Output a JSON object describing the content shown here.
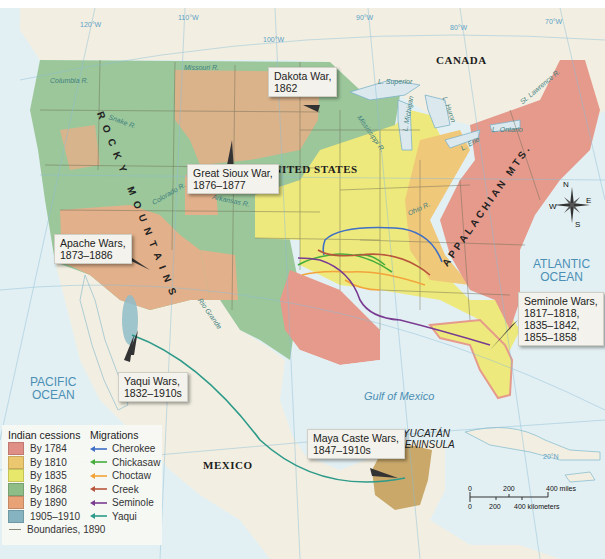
{
  "colors": {
    "ocean": "#e3f0f3",
    "land_other": "#f2efe2",
    "by_1784": "#e59a8c",
    "by_1810": "#f0c87a",
    "by_1835": "#eee97c",
    "by_1868": "#9cc79a",
    "by_1890": "#e2b08a",
    "by_1905_1910": "#8fbcc8",
    "yucatan": "#c9a86a",
    "cherokee": "#3f6fc6",
    "chickasaw": "#46ad3c",
    "choctaw": "#f2a33a",
    "creek": "#b8553d",
    "seminole": "#7a3c92",
    "yaqui": "#2e9a8a"
  },
  "regions": {
    "countries": [
      "CANADA",
      "UNITED STATES",
      "MEXICO"
    ],
    "oceans": [
      {
        "name": "PACIFIC\nOCEAN"
      },
      {
        "name": "ATLANTIC\nOCEAN"
      },
      {
        "name": "Gulf of Mexico"
      }
    ],
    "peninsula": "YUCATÁN\nPENINSULA",
    "mountains": [
      "ROCKY MOUNTAINS",
      "APPALACHIAN MTS."
    ],
    "rivers": [
      "Columbia R.",
      "Snake R.",
      "Missouri R.",
      "Colorado R.",
      "Arkansas R.",
      "Rio Grande",
      "Mississippi R.",
      "Ohio R.",
      "St. Lawrence R."
    ],
    "lakes": [
      "L. Superior",
      "L. Michigan",
      "L. Huron",
      "L. Erie",
      "L. Ontario"
    ]
  },
  "graticule": [
    "120°W",
    "110°W",
    "100°W",
    "90°W",
    "80°W",
    "70°W",
    "20°N"
  ],
  "callouts": [
    {
      "id": "dakota",
      "text": "Dakota War,\n1862"
    },
    {
      "id": "sioux",
      "text": "Great Sioux War,\n1876–1877"
    },
    {
      "id": "apache",
      "text": "Apache Wars,\n1873–1886"
    },
    {
      "id": "seminole",
      "text": "Seminole Wars,\n1817–1818,\n1835–1842,\n1855–1858"
    },
    {
      "id": "yaqui",
      "text": "Yaqui Wars,\n1832–1910s"
    },
    {
      "id": "maya",
      "text": "Maya Caste Wars,\n1847–1910s"
    }
  ],
  "compass": {
    "n": "N",
    "s": "S",
    "e": "E",
    "w": "W"
  },
  "scale": {
    "miles": [
      "0",
      "200",
      "400 miles"
    ],
    "km": [
      "0",
      "200",
      "400 kilometers"
    ]
  },
  "legend": {
    "cessions_title": "Indian cessions",
    "cessions": [
      {
        "label": "By 1784",
        "color": "#e08f86"
      },
      {
        "label": "By 1810",
        "color": "#ebc76f"
      },
      {
        "label": "By 1835",
        "color": "#e7e76c"
      },
      {
        "label": "By 1868",
        "color": "#8fbd87"
      },
      {
        "label": "By 1890",
        "color": "#e7a276"
      },
      {
        "label": "1905–1910",
        "color": "#86b3c0"
      }
    ],
    "boundaries_label": "Boundaries, 1890",
    "migrations_title": "Migrations",
    "migrations": [
      {
        "label": "Cherokee",
        "color": "#3f6fc6"
      },
      {
        "label": "Chickasaw",
        "color": "#46ad3c"
      },
      {
        "label": "Choctaw",
        "color": "#f2a33a"
      },
      {
        "label": "Creek",
        "color": "#b8553d"
      },
      {
        "label": "Seminole",
        "color": "#7a3c92"
      },
      {
        "label": "Yaqui",
        "color": "#2e9a8a"
      }
    ]
  }
}
